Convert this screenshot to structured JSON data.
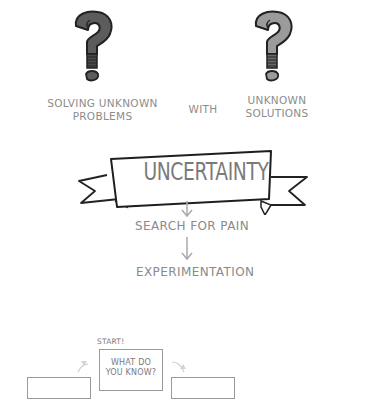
{
  "top": {
    "left_icon": "question-mark-dark-icon",
    "right_icon": "question-mark-light-icon",
    "left_label_line1": "SOLVING UNKNOWN",
    "left_label_line2": "PROBLEMS",
    "connector": "WITH",
    "right_label_line1": "UNKNOWN",
    "right_label_line2": "SOLUTIONS",
    "colors": {
      "dark_q": "#5a5a5a",
      "light_q": "#9a9a9a"
    }
  },
  "banner": {
    "title": "UNCERTAINTY"
  },
  "flow": {
    "step1": "SEARCH FOR PAIN",
    "step2": "EXPERIMENTATION"
  },
  "cycle": {
    "start_label": "START!",
    "center_box_line1": "WHAT DO",
    "center_box_line2": "YOU KNOW?"
  }
}
